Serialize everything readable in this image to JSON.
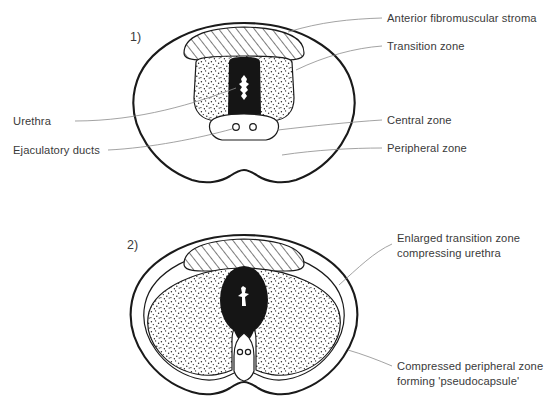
{
  "figure": {
    "background_color": "#ffffff",
    "ink_color": "#1a1a1a",
    "leader_color": "#8c8c8c"
  },
  "panels": [
    {
      "number": "1)",
      "description": "Normal prostate cross-section",
      "labels": [
        {
          "key": "anterior_fibromuscular_stroma",
          "text": "Anterior fibromuscular stroma",
          "side": "right"
        },
        {
          "key": "transition_zone",
          "text": "Transition zone",
          "side": "right"
        },
        {
          "key": "central_zone",
          "text": "Central zone",
          "side": "right"
        },
        {
          "key": "peripheral_zone",
          "text": "Peripheral zone",
          "side": "right"
        },
        {
          "key": "urethra",
          "text": "Urethra",
          "side": "left"
        },
        {
          "key": "ejaculatory_ducts",
          "text": "Ejaculatory ducts",
          "side": "left"
        }
      ]
    },
    {
      "number": "2)",
      "description": "Benign prostatic hyperplasia cross-section",
      "labels": [
        {
          "key": "enlarged_transition_zone",
          "text_line1": "Enlarged transition zone",
          "text_line2": "compressing urethra",
          "side": "right"
        },
        {
          "key": "compressed_peripheral_zone",
          "text_line1": "Compressed peripheral zone",
          "text_line2": "forming 'pseudocapsule'",
          "side": "right"
        }
      ]
    }
  ],
  "legend_keys": {
    "hatched": "anterior fibromuscular stroma",
    "stippled": "transition zone",
    "solid_black": "urethra wall / enlarged transition tissue",
    "white": "peripheral zone and central zone"
  }
}
